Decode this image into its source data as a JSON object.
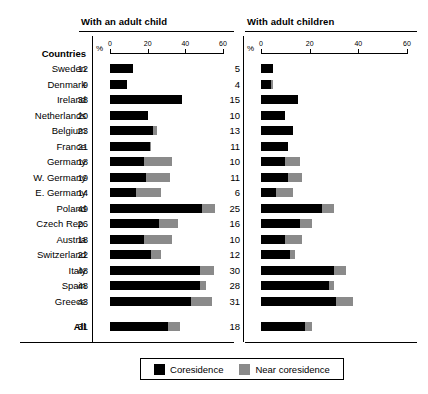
{
  "panels": {
    "left": {
      "title": "With an adult child",
      "axis_unit": "%"
    },
    "right": {
      "title": "With adult children",
      "axis_unit": "%"
    }
  },
  "row_header_label": "Countries",
  "total_label": "All",
  "legend": {
    "coresidence_label": "Coresidence",
    "near_coresidence_label": "Near coresidence",
    "coresidence_color": "#000000",
    "near_coresidence_color": "#8a8a8a"
  },
  "axis": {
    "ticks": [
      0,
      20,
      40,
      60
    ],
    "tick_labels": [
      "0",
      "20",
      "40",
      "60"
    ],
    "min": 0,
    "max": 60,
    "unit_label": "%"
  },
  "chart_data": {
    "type": "bar",
    "title": "",
    "orientation": "horizontal",
    "stacked": true,
    "grid": false,
    "xlabel": "%",
    "ylabel": "Countries",
    "xlim": [
      0,
      60
    ],
    "legend_position": "bottom",
    "panels": [
      {
        "name": "With an adult child",
        "categories": [
          "Sweden",
          "Denmark",
          "Ireland",
          "Netherlands",
          "Belgium",
          "France",
          "Germany",
          "W. Germany",
          "E. Germany",
          "Poland",
          "Czech Rep.",
          "Austria",
          "Switzerland",
          "Italy",
          "Spain",
          "Greece",
          "All"
        ],
        "series": [
          {
            "name": "Coresidence",
            "values": [
              12,
              9,
              38,
              20,
              23,
              21,
              18,
              19,
              14,
              49,
              26,
              18,
              22,
              48,
              48,
              43,
              31
            ]
          },
          {
            "name": "Near coresidence",
            "values": [
              0,
              0,
              0,
              0,
              2,
              1,
              15,
              13,
              13,
              7,
              10,
              15,
              5,
              7,
              3,
              11,
              6
            ]
          }
        ],
        "labels": [
          "12",
          "9",
          "38",
          "20",
          "23",
          "21",
          "18",
          "19",
          "14",
          "49",
          "26",
          "18",
          "22",
          "48",
          "48",
          "43",
          "31"
        ]
      },
      {
        "name": "With adult children",
        "categories": [
          "Sweden",
          "Denmark",
          "Ireland",
          "Netherlands",
          "Belgium",
          "France",
          "Germany",
          "W. Germany",
          "E. Germany",
          "Poland",
          "Czech Rep.",
          "Austria",
          "Switzerland",
          "Italy",
          "Spain",
          "Greece",
          "All"
        ],
        "series": [
          {
            "name": "Coresidence",
            "values": [
              5,
              4,
              15,
              10,
              13,
              11,
              10,
              11,
              6,
              25,
              16,
              10,
              12,
              30,
              28,
              31,
              18
            ]
          },
          {
            "name": "Near coresidence",
            "values": [
              0,
              1,
              0,
              0,
              0,
              0,
              6,
              6,
              7,
              5,
              5,
              7,
              2,
              5,
              2,
              7,
              3
            ]
          }
        ],
        "labels": [
          "5",
          "4",
          "15",
          "10",
          "13",
          "11",
          "10",
          "11",
          "6",
          "25",
          "16",
          "10",
          "12",
          "30",
          "28",
          "31",
          "18"
        ]
      }
    ]
  }
}
